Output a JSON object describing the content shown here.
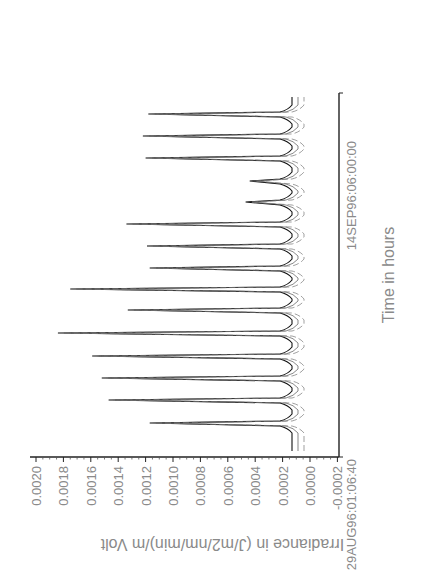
{
  "chart_data": {
    "type": "line",
    "orientation": "rotated-90-clockwise",
    "title": "",
    "xlabel": "Time in hours",
    "ylabel": "Irradiance in (J/m2/nm/min)/m Volt",
    "x_start_label": "29AUG96:01:06:40",
    "x_end_label": "14SEP96:06:00:00",
    "ylim": [
      -0.0002,
      0.002
    ],
    "y_ticks": [
      "0.0020",
      "0.0018",
      "0.0016",
      "0.0014",
      "0.0012",
      "0.0010",
      "0.0008",
      "0.0006",
      "0.0004",
      "0.0002",
      "0.0000",
      "-0.0002"
    ],
    "y_tick_values": [
      0.002,
      0.0018,
      0.0016,
      0.0014,
      0.0012,
      0.001,
      0.0008,
      0.0006,
      0.0004,
      0.0002,
      0.0,
      -0.0002
    ],
    "grid": false,
    "legend": null,
    "series": [
      {
        "name": "Irradiance (daily peaks, chronological)",
        "style": "multiple overlaid traces (solid + dashed)",
        "day_index": [
          1,
          2,
          3,
          4,
          5,
          6,
          7,
          8,
          9,
          10,
          11,
          12,
          13,
          14,
          15
        ],
        "values": [
          0.00117,
          0.00147,
          0.00152,
          0.00159,
          0.00184,
          0.00133,
          0.00175,
          0.00117,
          0.00119,
          0.00134,
          0.00047,
          0.00044,
          0.0012,
          0.00122,
          0.00118
        ]
      }
    ],
    "baseline_night_value": 0.0
  },
  "layout_px": {
    "time_axis_x": 339,
    "time_axis_top": 93,
    "time_axis_bottom": 457,
    "value_axis_y": 457,
    "value_axis_left": 30,
    "value_px_at_0020": 36,
    "value_px_at_0000": 310,
    "peak_y_positions": [
      423,
      400,
      378,
      356,
      333,
      310,
      289,
      268,
      246,
      224,
      202,
      181,
      158,
      136,
      114
    ]
  }
}
